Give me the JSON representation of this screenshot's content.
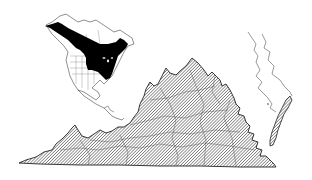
{
  "figure": {
    "type": "species-range-map",
    "background": "#ffffff",
    "main_map": {
      "region": "Virginia",
      "fill_style": "diagonal-hatch",
      "hatch_color": "#333333",
      "boundary_color": "#222222",
      "shows_county_boundaries": true,
      "range_coverage": "statewide"
    },
    "inset_map": {
      "region": "North America",
      "range_fill": "#000000",
      "outline_color": "#444444",
      "range_description": "boreal Canada and Alaska southward through the northeastern and north-central United States to the southern Appalachians"
    },
    "adjacent_outline": {
      "region": "Chesapeake Bay / Delmarva shoreline",
      "style": "outline-only"
    },
    "text_labels": []
  }
}
